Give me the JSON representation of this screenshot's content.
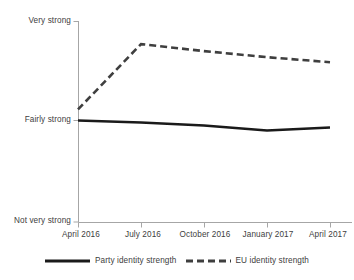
{
  "chart_data": {
    "type": "line",
    "title": "",
    "subtitle": "",
    "xlabel": "",
    "ylabel": "",
    "grid": false,
    "legend_position": "bottom",
    "categories": [
      "April 2016",
      "July 2016",
      "October 2016",
      "January 2017",
      "April 2017"
    ],
    "x": [
      0,
      1,
      2,
      3,
      4
    ],
    "ylim": [
      1,
      3
    ],
    "ytick_values": [
      3,
      2,
      1
    ],
    "ytick_labels": [
      "Very strong",
      "Fairly strong",
      "Not very strong"
    ],
    "series": [
      {
        "name": "Party identity strength",
        "style": "solid",
        "color": "#1a1a1a",
        "values": [
          2.01,
          1.99,
          1.96,
          1.91,
          1.94
        ]
      },
      {
        "name": "EU identity strength",
        "style": "dashed",
        "color": "#3f3f3f",
        "values": [
          2.12,
          2.77,
          2.7,
          2.64,
          2.59
        ]
      }
    ]
  },
  "axis": {
    "y_labels": [
      {
        "text": "Very strong",
        "value": 3
      },
      {
        "text": "Fairly strong",
        "value": 2
      },
      {
        "text": "Not very strong",
        "value": 1
      }
    ],
    "x_labels": [
      {
        "text": "April 2016"
      },
      {
        "text": "July 2016"
      },
      {
        "text": "October 2016"
      },
      {
        "text": "January 2017"
      },
      {
        "text": "April 2017"
      }
    ]
  },
  "legend": {
    "items": [
      {
        "label": "Party identity strength",
        "style": "solid"
      },
      {
        "label": "EU identity strength",
        "style": "dashed"
      }
    ]
  },
  "colors": {
    "background": "#ffffff",
    "axis": "#a6a6a6",
    "text": "#404040",
    "series_solid": "#1a1a1a",
    "series_dashed": "#3f3f3f"
  }
}
